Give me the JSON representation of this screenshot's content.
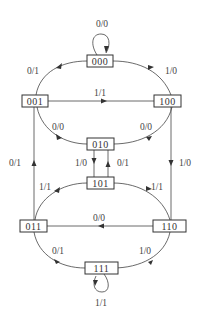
{
  "diagram": {
    "type": "state-transition-diagram",
    "states": [
      {
        "id": "s000",
        "label": "000"
      },
      {
        "id": "s001",
        "label": "001"
      },
      {
        "id": "s100",
        "label": "100"
      },
      {
        "id": "s010",
        "label": "010"
      },
      {
        "id": "s101",
        "label": "101"
      },
      {
        "id": "s011",
        "label": "011"
      },
      {
        "id": "s110",
        "label": "110"
      },
      {
        "id": "s111",
        "label": "111"
      }
    ],
    "transitions": [
      {
        "from": "000",
        "to": "000",
        "label": "0/0"
      },
      {
        "from": "001",
        "to": "000",
        "label": "0/1"
      },
      {
        "from": "000",
        "to": "100",
        "label": "1/0"
      },
      {
        "from": "001",
        "to": "100",
        "label": "1/1"
      },
      {
        "from": "001",
        "to": "010",
        "label": "0/0"
      },
      {
        "from": "100",
        "to": "010",
        "label": "0/0"
      },
      {
        "from": "010",
        "to": "101",
        "label": "1/0"
      },
      {
        "from": "101",
        "to": "010",
        "label": "0/1"
      },
      {
        "from": "011",
        "to": "001",
        "label": "0/1"
      },
      {
        "from": "100",
        "to": "110",
        "label": "1/0"
      },
      {
        "from": "011",
        "to": "101",
        "label": "1/1"
      },
      {
        "from": "101",
        "to": "110",
        "label": "1/1"
      },
      {
        "from": "110",
        "to": "011",
        "label": "0/0"
      },
      {
        "from": "111",
        "to": "011",
        "label": "0/1"
      },
      {
        "from": "110",
        "to": "111",
        "label": "1/0"
      },
      {
        "from": "111",
        "to": "111",
        "label": "1/1"
      }
    ]
  }
}
